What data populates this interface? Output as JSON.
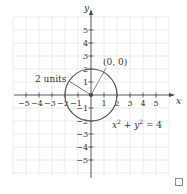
{
  "diagram": {
    "axes": {
      "x_label": "x",
      "y_label": "y",
      "x_ticks": [
        "−5",
        "−4",
        "−3",
        "−2",
        "−1",
        "1",
        "2",
        "3",
        "4",
        "5"
      ],
      "y_ticks_positive": [
        "5",
        "4",
        "3",
        "2",
        "1"
      ],
      "y_ticks_negative": [
        "−1",
        "−2",
        "−3",
        "−4",
        "−5"
      ],
      "range": [
        -6,
        6
      ]
    },
    "circle": {
      "center": [
        0,
        0
      ],
      "radius": 2,
      "color": "#555555"
    },
    "labels": {
      "center_label": "(0, 0)",
      "radius_label": "2 units",
      "equation_base_x": "x",
      "equation_exp_x": "2",
      "equation_plus": " + ",
      "equation_base_y": "y",
      "equation_exp_y": "2",
      "equation_rhs": " = 4"
    },
    "colors": {
      "grid": "#e4e4e4",
      "axis": "#444444",
      "text": "#333333"
    }
  },
  "controls": {
    "expand_icon": "square-outline-icon"
  }
}
